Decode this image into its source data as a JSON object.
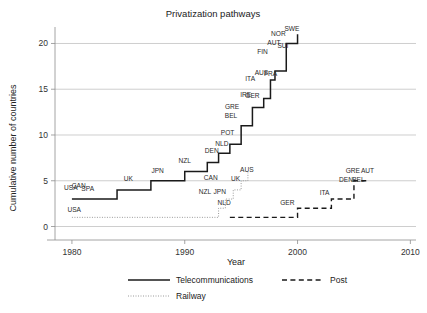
{
  "chart_data": {
    "type": "line",
    "title": "Privatization pathways",
    "xlabel": "Year",
    "ylabel": "Cumulative number of countries",
    "xlim": [
      1978.5,
      2010.5
    ],
    "ylim": [
      -0.6,
      21.8
    ],
    "xticks": [
      "1980",
      "1990",
      "2000",
      "2010"
    ],
    "xtick_values": [
      1980,
      1990,
      2000,
      2010
    ],
    "yticks": [
      "0",
      "5",
      "10",
      "15",
      "20"
    ],
    "ytick_values": [
      0,
      5,
      10,
      15,
      20
    ],
    "grid": "horizontal",
    "legend_position": "bottom",
    "series": [
      {
        "name": "Telecommunications",
        "style": "solid",
        "steps": [
          {
            "year": 1980,
            "value": 3
          },
          {
            "year": 1984,
            "value": 4
          },
          {
            "year": 1987,
            "value": 5
          },
          {
            "year": 1990,
            "value": 6
          },
          {
            "year": 1992,
            "value": 7
          },
          {
            "year": 1993,
            "value": 8
          },
          {
            "year": 1994,
            "value": 9
          },
          {
            "year": 1995,
            "value": 11
          },
          {
            "year": 1996,
            "value": 13
          },
          {
            "year": 1997,
            "value": 14
          },
          {
            "year": 1997.6,
            "value": 16
          },
          {
            "year": 1998,
            "value": 17
          },
          {
            "year": 1999,
            "value": 20
          },
          {
            "year": 2000,
            "value": 21
          }
        ],
        "labels": [
          {
            "text": "USA",
            "year": 1979.9,
            "value": 4.0
          },
          {
            "text": "CAN",
            "year": 1980.6,
            "value": 4.2
          },
          {
            "text": "SPA",
            "year": 1981.4,
            "value": 3.9
          },
          {
            "text": "UK",
            "year": 1985.0,
            "value": 5.0
          },
          {
            "text": "JPN",
            "year": 1987.6,
            "value": 5.9
          },
          {
            "text": "NZL",
            "year": 1990.0,
            "value": 6.9
          },
          {
            "text": "CAN",
            "year": 1992.3,
            "value": 5.1
          },
          {
            "text": "DEN",
            "year": 1992.4,
            "value": 8.0
          },
          {
            "text": "NLD",
            "year": 1993.3,
            "value": 8.8
          },
          {
            "text": "POT",
            "year": 1993.8,
            "value": 10.0
          },
          {
            "text": "BEL",
            "year": 1994.1,
            "value": 11.9
          },
          {
            "text": "GRE",
            "year": 1994.2,
            "value": 12.8
          },
          {
            "text": "IRE",
            "year": 1995.4,
            "value": 14.1
          },
          {
            "text": "GER",
            "year": 1996.0,
            "value": 14.0
          },
          {
            "text": "ITA",
            "year": 1995.8,
            "value": 15.9
          },
          {
            "text": "AUS",
            "year": 1996.8,
            "value": 16.6
          },
          {
            "text": "FRA",
            "year": 1997.6,
            "value": 16.5
          },
          {
            "text": "FIN",
            "year": 1996.9,
            "value": 18.9
          },
          {
            "text": "AUT",
            "year": 1997.9,
            "value": 19.8
          },
          {
            "text": "SUI",
            "year": 1998.7,
            "value": 19.5
          },
          {
            "text": "NOR",
            "year": 1998.3,
            "value": 20.8
          },
          {
            "text": "SWE",
            "year": 1999.5,
            "value": 21.4
          }
        ]
      },
      {
        "name": "Post",
        "style": "dashed",
        "steps": [
          {
            "year": 1994,
            "value": 1
          },
          {
            "year": 2000,
            "value": 2
          },
          {
            "year": 2003,
            "value": 3
          },
          {
            "year": 2005,
            "value": 5
          },
          {
            "year": 2006,
            "value": 5
          },
          {
            "year": 2006.2,
            "value": 5
          }
        ],
        "labels": [
          {
            "text": "GER",
            "year": 1999.1,
            "value": 2.4
          },
          {
            "text": "ITA",
            "year": 2002.4,
            "value": 3.4
          },
          {
            "text": "DEN",
            "year": 2004.3,
            "value": 4.9
          },
          {
            "text": "BEL",
            "year": 2005.4,
            "value": 4.9
          },
          {
            "text": "GRE",
            "year": 2004.9,
            "value": 5.9
          },
          {
            "text": "AUT",
            "year": 2006.2,
            "value": 5.9
          }
        ]
      },
      {
        "name": "Railway",
        "style": "dotted",
        "steps": [
          {
            "year": 1980,
            "value": 1
          },
          {
            "year": 1993,
            "value": 2
          },
          {
            "year": 1993.6,
            "value": 3
          },
          {
            "year": 1994.3,
            "value": 4
          },
          {
            "year": 1995,
            "value": 5
          },
          {
            "year": 1995.6,
            "value": 5.9
          }
        ],
        "labels": [
          {
            "text": "USA",
            "year": 1980.2,
            "value": 1.6
          },
          {
            "text": "NZL",
            "year": 1991.8,
            "value": 3.6
          },
          {
            "text": "JPN",
            "year": 1993.1,
            "value": 3.6
          },
          {
            "text": "NLD",
            "year": 1993.5,
            "value": 2.3
          },
          {
            "text": "UK",
            "year": 1994.5,
            "value": 5.0
          },
          {
            "text": "AUS",
            "year": 1995.5,
            "value": 6.0
          }
        ]
      }
    ]
  },
  "legend": {
    "items": [
      {
        "label": "Telecommunications",
        "style": "solid"
      },
      {
        "label": "Post",
        "style": "dashed"
      },
      {
        "label": "Railway",
        "style": "dotted"
      }
    ]
  }
}
